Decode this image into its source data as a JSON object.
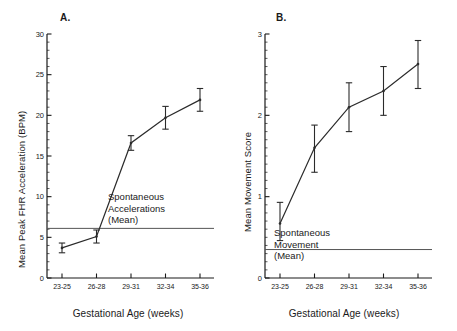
{
  "figure": {
    "background": "#ffffff",
    "ink": "#1a1a1a",
    "line_color": "#2b2b2b"
  },
  "panels": [
    {
      "label": "A.",
      "ylabel": "Mean Peak FHR Acceleration (BPM)",
      "xlabel": "Gestational Age (weeks)",
      "annotation_lines": [
        "Spontaneous",
        "Accelerations",
        "(Mean)"
      ],
      "ytick_labels": [
        "0",
        "5",
        "10",
        "15",
        "20",
        "25",
        "30"
      ],
      "xtick_labels": [
        "23-25",
        "26-28",
        "29-31",
        "32-34",
        "35-36"
      ]
    },
    {
      "label": "B.",
      "ylabel": "Mean Movement Score",
      "xlabel": "Gestational Age (weeks)",
      "annotation_lines": [
        "Spontaneous",
        "Movement",
        "(Mean)"
      ],
      "ytick_labels": [
        "0",
        "1",
        "2",
        "3"
      ],
      "xtick_labels": [
        "23-25",
        "26-28",
        "29-31",
        "32-34",
        "35-36"
      ]
    }
  ],
  "chart_data": [
    {
      "type": "line",
      "panel": "A.",
      "title": "Mean Peak FHR Acceleration by Gestational Age",
      "xlabel": "Gestational Age (weeks)",
      "ylabel": "Mean Peak FHR Acceleration (BPM)",
      "categories": [
        "23-25",
        "26-28",
        "29-31",
        "32-34",
        "35-36"
      ],
      "values": [
        3.7,
        5.1,
        16.6,
        19.7,
        21.9
      ],
      "error_low": [
        3.1,
        4.3,
        15.7,
        18.3,
        20.5
      ],
      "error_high": [
        4.3,
        5.9,
        17.5,
        21.1,
        23.3
      ],
      "error_type": "error-bars",
      "ylim": [
        0,
        30
      ],
      "yticks": [
        0,
        5,
        10,
        15,
        20,
        25,
        30
      ],
      "yminor_step": 1,
      "grid": false,
      "legend": "none",
      "reference_line": {
        "value": 6.1,
        "label_lines": [
          "Spontaneous",
          "Accelerations",
          "(Mean)"
        ]
      }
    },
    {
      "type": "line",
      "panel": "B.",
      "title": "Mean Movement Score by Gestational Age",
      "xlabel": "Gestational Age (weeks)",
      "ylabel": "Mean Movement Score",
      "categories": [
        "23-25",
        "26-28",
        "29-31",
        "32-34",
        "35-36"
      ],
      "values": [
        0.67,
        1.6,
        2.1,
        2.3,
        2.63
      ],
      "error_low": [
        0.46,
        1.3,
        1.8,
        2.0,
        2.33
      ],
      "error_high": [
        0.93,
        1.88,
        2.4,
        2.6,
        2.92
      ],
      "error_type": "error-bars",
      "ylim": [
        0,
        3
      ],
      "yticks": [
        0,
        1,
        2,
        3
      ],
      "yminor_step": 0.1,
      "grid": false,
      "legend": "none",
      "reference_line": {
        "value": 0.35,
        "label_lines": [
          "Spontaneous",
          "Movement",
          "(Mean)"
        ]
      }
    }
  ]
}
